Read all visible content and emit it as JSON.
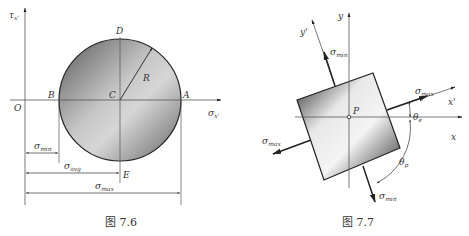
{
  "figure_left": {
    "caption": "图 7.6",
    "axis_labels": {
      "vertical": "τ",
      "vertical_sub": "x'",
      "horizontal": "σ",
      "horizontal_sub": "x'"
    },
    "point_labels": {
      "origin": "O",
      "A": "A",
      "B": "B",
      "C": "C",
      "D": "D",
      "E": "E",
      "radius": "R"
    },
    "dimensions": [
      {
        "symbol": "σ",
        "sub": "min"
      },
      {
        "symbol": "σ",
        "sub": "avg"
      },
      {
        "symbol": "σ",
        "sub": "max"
      }
    ]
  },
  "figure_right": {
    "caption": "图 7.7",
    "axis_labels": {
      "x": "x",
      "y": "y",
      "x_prime": "x'",
      "y_prime": "y'"
    },
    "point_label": "P",
    "stress_labels": {
      "top": {
        "symbol": "σ",
        "sub": "min"
      },
      "right": {
        "symbol": "σ",
        "sub": "max"
      },
      "left": {
        "symbol": "σ",
        "sub": "max"
      },
      "bottom": {
        "symbol": "σ",
        "sub": "min"
      }
    },
    "angles": [
      {
        "symbol": "θ",
        "sub": "e"
      },
      {
        "symbol": "θ",
        "sub": "p"
      }
    ]
  }
}
